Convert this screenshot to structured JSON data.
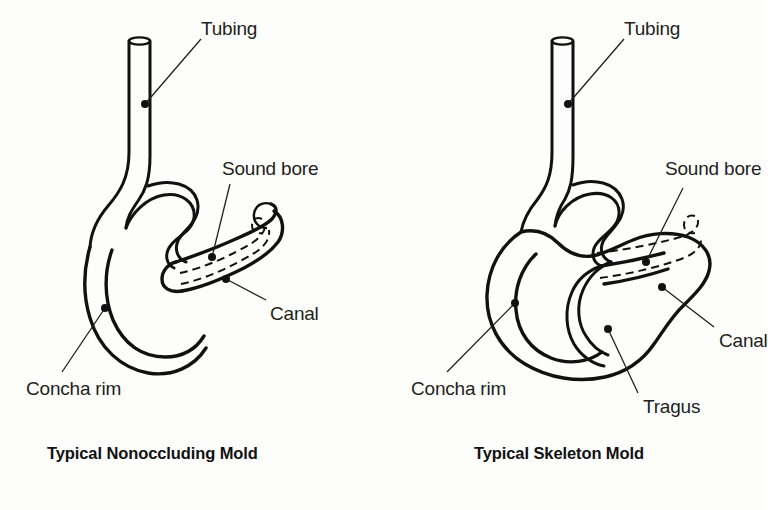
{
  "figure": {
    "title_visible": false,
    "background_color": "#fdfdfc",
    "ink_color": "#111111",
    "label_color": "#231f20"
  },
  "panels": [
    {
      "id": "nonoccluding",
      "caption": "Typical Nonoccluding Mold",
      "labels": [
        {
          "key": "tubing",
          "text": "Tubing"
        },
        {
          "key": "sound_bore",
          "text": "Sound bore"
        },
        {
          "key": "canal",
          "text": "Canal"
        },
        {
          "key": "concha_rim",
          "text": "Concha rim"
        }
      ]
    },
    {
      "id": "skeleton",
      "caption": "Typical Skeleton Mold",
      "labels": [
        {
          "key": "tubing",
          "text": "Tubing"
        },
        {
          "key": "sound_bore",
          "text": "Sound bore"
        },
        {
          "key": "canal",
          "text": "Canal"
        },
        {
          "key": "tragus",
          "text": "Tragus"
        },
        {
          "key": "concha_rim",
          "text": "Concha rim"
        }
      ]
    }
  ],
  "left": {
    "caption": "Typical Nonoccluding Mold",
    "label_tubing": "Tubing",
    "label_sound_bore": "Sound bore",
    "label_canal": "Canal",
    "label_concha_rim": "Concha rim"
  },
  "right": {
    "caption": "Typical Skeleton Mold",
    "label_tubing": "Tubing",
    "label_sound_bore": "Sound bore",
    "label_canal": "Canal",
    "label_tragus": "Tragus",
    "label_concha_rim": "Concha rim"
  }
}
